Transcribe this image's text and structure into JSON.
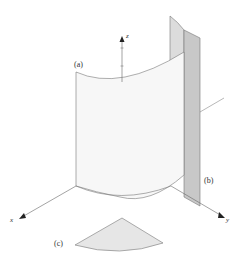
{
  "diagram": {
    "labels": {
      "a": "(a)",
      "b": "(b)",
      "c": "(c)"
    },
    "axes": {
      "x": "x",
      "y": "y",
      "z": "z"
    },
    "colors": {
      "surface_a": "#f7f7f7",
      "surface_a_back": "#dcdcdc",
      "plane_b": "#c8c8c8",
      "sector_c": "#e6e6e6",
      "stroke": "#6e6e6e",
      "axis": "#555555"
    },
    "parts": [
      {
        "id": "a",
        "description": "cylindrical surface segment standing on xy-plane"
      },
      {
        "id": "b",
        "description": "vertical plane strip parallel to z-axis"
      },
      {
        "id": "c",
        "description": "circular sector (base projection)"
      }
    ]
  }
}
